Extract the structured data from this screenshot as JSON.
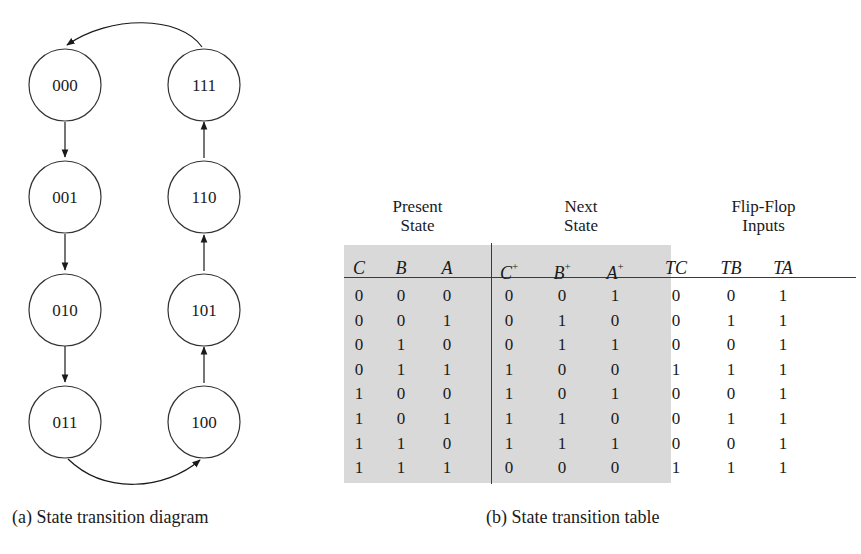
{
  "diagram": {
    "caption": "(a) State transition diagram",
    "states": [
      {
        "label": "000"
      },
      {
        "label": "001"
      },
      {
        "label": "010"
      },
      {
        "label": "011"
      },
      {
        "label": "100"
      },
      {
        "label": "101"
      },
      {
        "label": "110"
      },
      {
        "label": "111"
      }
    ],
    "transitions": [
      [
        "000",
        "001"
      ],
      [
        "001",
        "010"
      ],
      [
        "010",
        "011"
      ],
      [
        "011",
        "100"
      ],
      [
        "100",
        "101"
      ],
      [
        "101",
        "110"
      ],
      [
        "110",
        "111"
      ],
      [
        "111",
        "000"
      ]
    ]
  },
  "table": {
    "caption": "(b) State transition table",
    "groups": {
      "present": {
        "line1": "Present",
        "line2": "State"
      },
      "next": {
        "line1": "Next",
        "line2": "State"
      },
      "ff": {
        "line1": "Flip-Flop",
        "line2": "Inputs"
      }
    },
    "columns": [
      {
        "base": "C",
        "sup": ""
      },
      {
        "base": "B",
        "sup": ""
      },
      {
        "base": "A",
        "sup": ""
      },
      {
        "base": "C",
        "sup": "+"
      },
      {
        "base": "B",
        "sup": "+"
      },
      {
        "base": "A",
        "sup": "+"
      },
      {
        "base": "TC",
        "sup": ""
      },
      {
        "base": "TB",
        "sup": ""
      },
      {
        "base": "TA",
        "sup": ""
      }
    ],
    "rows": [
      [
        "0",
        "0",
        "0",
        "0",
        "0",
        "1",
        "0",
        "0",
        "1"
      ],
      [
        "0",
        "0",
        "1",
        "0",
        "1",
        "0",
        "0",
        "1",
        "1"
      ],
      [
        "0",
        "1",
        "0",
        "0",
        "1",
        "1",
        "0",
        "0",
        "1"
      ],
      [
        "0",
        "1",
        "1",
        "1",
        "0",
        "0",
        "1",
        "1",
        "1"
      ],
      [
        "1",
        "0",
        "0",
        "1",
        "0",
        "1",
        "0",
        "0",
        "1"
      ],
      [
        "1",
        "0",
        "1",
        "1",
        "1",
        "0",
        "0",
        "1",
        "1"
      ],
      [
        "1",
        "1",
        "0",
        "1",
        "1",
        "1",
        "0",
        "0",
        "1"
      ],
      [
        "1",
        "1",
        "1",
        "0",
        "0",
        "0",
        "1",
        "1",
        "1"
      ]
    ],
    "colors": {
      "shade": "#d9d9d9",
      "rule": "#3a3a3a"
    }
  }
}
